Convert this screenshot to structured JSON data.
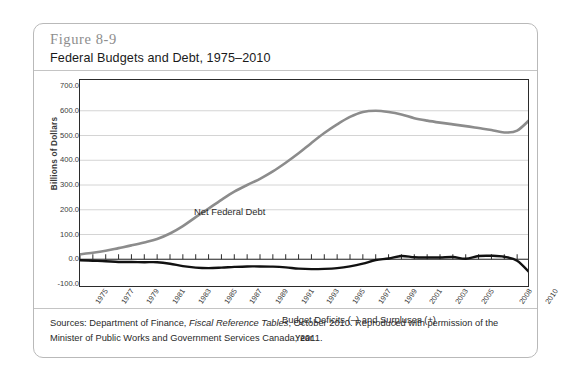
{
  "figure": {
    "number": "Figure 8-9",
    "title": "Federal Budgets and Debt, 1975–2010"
  },
  "source": {
    "prefix": "Sources: Department of Finance, ",
    "italic": "Fiscal Reference Tables",
    "suffix": ", October 2010. Reproduced with permission of the Minister of Public Works and Government Services Canada, 2011."
  },
  "colors": {
    "debt_line": "#8c8c8c",
    "deficit_line": "#111111",
    "axis": "#2b2b2b",
    "gridline": "#c9c9c9",
    "figure_number": "#8d8d8d"
  },
  "chart_data": {
    "type": "line",
    "title": "Federal Budgets and Debt, 1975–2010",
    "xlabel": "Year",
    "ylabel": "Billions of Dollars",
    "ylim": [
      -100.0,
      700.0
    ],
    "yticks": [
      "700.0",
      "600.0",
      "500.0",
      "400.0",
      "300.0",
      "200.0",
      "100.0",
      "0.0",
      "-100.0"
    ],
    "ytick_values": [
      700,
      600,
      500,
      400,
      300,
      200,
      100,
      0,
      -100
    ],
    "grid": true,
    "legend": "annotations",
    "xtick_labels": [
      "1975",
      "1977",
      "1979",
      "1981",
      "1983",
      "1985",
      "1987",
      "1989",
      "1991",
      "1993",
      "1995",
      "1997",
      "1999",
      "2001",
      "2003",
      "2005",
      "2008",
      "2010"
    ],
    "x": [
      1975,
      1976,
      1977,
      1978,
      1979,
      1980,
      1981,
      1982,
      1983,
      1984,
      1985,
      1986,
      1987,
      1988,
      1989,
      1990,
      1991,
      1992,
      1993,
      1994,
      1995,
      1996,
      1997,
      1998,
      1999,
      2000,
      2001,
      2002,
      2003,
      2004,
      2005,
      2006,
      2007,
      2008,
      2009,
      2010
    ],
    "annotations": [
      {
        "text": "Net Federal Debt",
        "series": "Net Federal Debt"
      },
      {
        "text": "Budget Deficits (–) and Surpluses (+)",
        "series": "Budget Balance"
      }
    ],
    "series": [
      {
        "name": "Net Federal Debt",
        "color": "#8c8c8c",
        "values": [
          20,
          26,
          34,
          45,
          56,
          68,
          82,
          104,
          134,
          170,
          205,
          240,
          273,
          300,
          325,
          355,
          390,
          428,
          470,
          510,
          545,
          575,
          595,
          600,
          595,
          585,
          570,
          560,
          552,
          545,
          538,
          530,
          522,
          512,
          520,
          565
        ]
      },
      {
        "name": "Budget Balance",
        "color": "#111111",
        "values": [
          -4,
          -6,
          -8,
          -11,
          -11,
          -12,
          -12,
          -18,
          -28,
          -34,
          -36,
          -34,
          -31,
          -29,
          -29,
          -30,
          -33,
          -38,
          -40,
          -39,
          -36,
          -29,
          -18,
          -3,
          3,
          13,
          8,
          7,
          7,
          9,
          2,
          13,
          14,
          10,
          -6,
          -56
        ]
      }
    ]
  }
}
